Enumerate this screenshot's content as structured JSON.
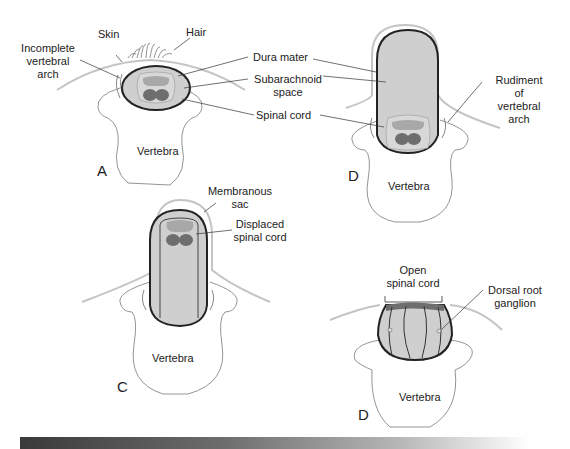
{
  "panels": {
    "A": {
      "letter": "A",
      "labels": {
        "skin": "Skin",
        "hair": "Hair",
        "incomplete_arch": "Incomplete\nvertebral\narch",
        "dura_mater": "Dura mater",
        "subarachnoid": "Subarachnoid\nspace",
        "spinal_cord": "Spinal cord",
        "vertebra": "Vertebra"
      }
    },
    "B": {
      "letter": "D",
      "labels": {
        "rudiment": "Rudiment of\nvertebral arch",
        "vertebra": "Vertebra"
      }
    },
    "C": {
      "letter": "C",
      "labels": {
        "membranous_sac": "Membranous\nsac",
        "displaced_cord": "Displaced\nspinal cord",
        "vertebra": "Vertebra"
      }
    },
    "D": {
      "letter": "D",
      "labels": {
        "open_cord": "Open\nspinal cord",
        "drg": "Dorsal root\nganglion",
        "vertebra": "Vertebra"
      }
    }
  },
  "colors": {
    "outline": "#222222",
    "sac_fill": "#cfcfcf",
    "cord_gray": "#a8a8a8",
    "cord_dark": "#6e6e6e",
    "skin_line": "#bdbdbd"
  }
}
